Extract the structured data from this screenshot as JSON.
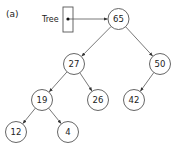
{
  "figure": {
    "panel_label": "(a)",
    "pointer": {
      "label": "Tree",
      "target": "65"
    }
  },
  "tree": {
    "root": "65",
    "nodes": [
      {
        "id": "65",
        "value": "65",
        "x": 118.5,
        "y": 19
      },
      {
        "id": "27",
        "value": "27",
        "x": 74,
        "y": 64
      },
      {
        "id": "50",
        "value": "50",
        "x": 160,
        "y": 64
      },
      {
        "id": "19",
        "value": "19",
        "x": 42,
        "y": 100
      },
      {
        "id": "26",
        "value": "26",
        "x": 98,
        "y": 100
      },
      {
        "id": "42",
        "value": "42",
        "x": 134,
        "y": 100
      },
      {
        "id": "12",
        "value": "12",
        "x": 16,
        "y": 132
      },
      {
        "id": "4",
        "value": "4",
        "x": 68,
        "y": 132
      }
    ],
    "edges": [
      {
        "from": "65",
        "to": "27"
      },
      {
        "from": "65",
        "to": "50"
      },
      {
        "from": "27",
        "to": "19"
      },
      {
        "from": "27",
        "to": "26"
      },
      {
        "from": "50",
        "to": "42"
      },
      {
        "from": "19",
        "to": "12"
      },
      {
        "from": "19",
        "to": "4"
      }
    ]
  }
}
